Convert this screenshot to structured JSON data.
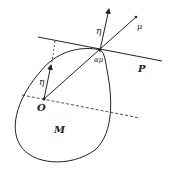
{
  "labels": {
    "eta_top": "η",
    "mu": "μ",
    "alpha_mu": "αμ",
    "plane": "P",
    "eta_origin": "η",
    "origin": "O",
    "region": "M"
  },
  "colors": {
    "stroke": "#222222",
    "background": "#ffffff"
  }
}
